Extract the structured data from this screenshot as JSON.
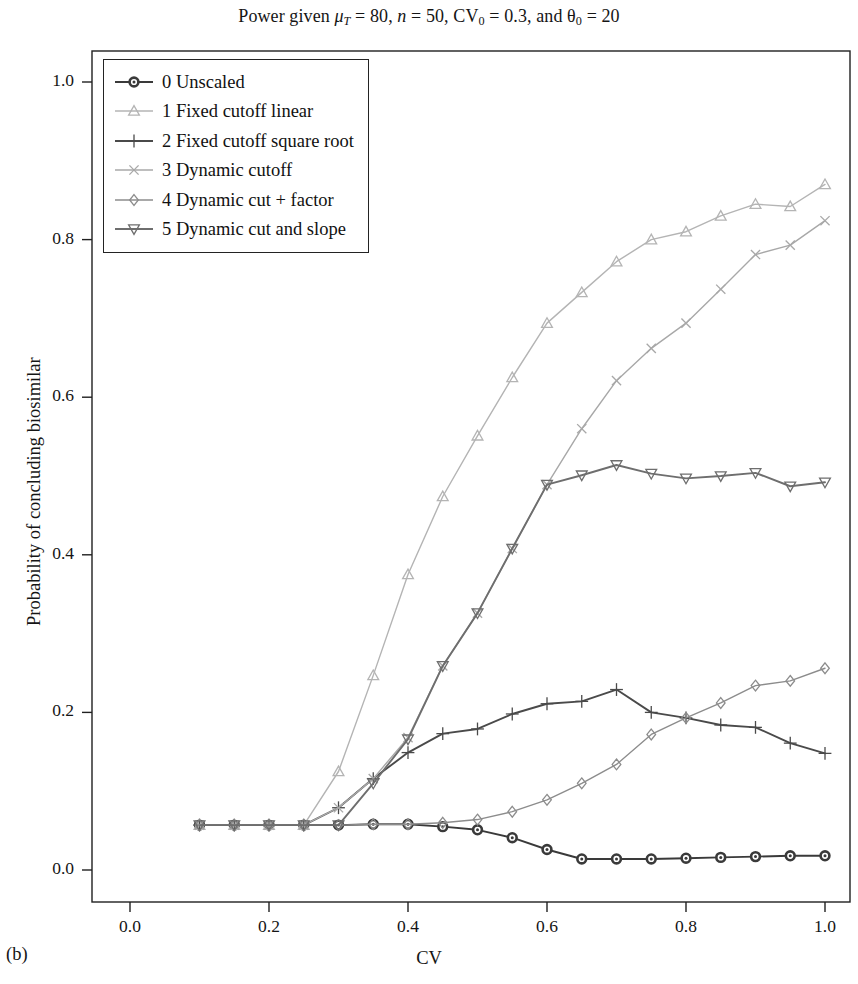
{
  "figure": {
    "panel_label": "(b)",
    "title_plain": "Power given μ_T = 80, n = 50, CV_0 = 0.3, and θ_0 = 20",
    "title_parts": {
      "lead": "Power given ",
      "mu": "μ",
      "mu_sub": "T",
      "mu_val": " = 80, ",
      "n": "n",
      "n_val": " = 50, ",
      "cv": "CV",
      "cv_sub": "0",
      "cv_val": " = 0.3, and ",
      "theta": "θ",
      "theta_sub": "0",
      "theta_val": " = 20"
    }
  },
  "chart_data": {
    "type": "line",
    "xlabel": "CV",
    "ylabel": "Probability of concluding biosimilar",
    "xlim": [
      0.0,
      1.06
    ],
    "ylim": [
      0.0,
      1.04
    ],
    "xticks": [
      0.0,
      0.2,
      0.4,
      0.6,
      0.8,
      1.0
    ],
    "xticklabels": [
      "0.0",
      "0.2",
      "0.4",
      "0.6",
      "0.8",
      "1.0"
    ],
    "yticks": [
      0.0,
      0.2,
      0.4,
      0.6,
      0.8,
      1.0
    ],
    "yticklabels": [
      "0.0",
      "0.2",
      "0.4",
      "0.6",
      "0.8",
      "1.0"
    ],
    "grid": false,
    "legend_position": "upper left",
    "x": [
      0.1,
      0.15,
      0.2,
      0.25,
      0.3,
      0.35,
      0.4,
      0.45,
      0.5,
      0.55,
      0.6,
      0.65,
      0.7,
      0.75,
      0.8,
      0.85,
      0.9,
      0.95,
      1.0
    ],
    "series": [
      {
        "name": "0 Unscaled",
        "index": 0,
        "marker": "circle-filled",
        "color": "#3a3a3a",
        "values": [
          0.057,
          0.057,
          0.057,
          0.057,
          0.057,
          0.058,
          0.058,
          0.055,
          0.051,
          0.041,
          0.026,
          0.014,
          0.014,
          0.014,
          0.015,
          0.016,
          0.017,
          0.018,
          0.018
        ]
      },
      {
        "name": "1 Fixed cutoff linear",
        "index": 1,
        "marker": "triangle-up",
        "color": "#b4b4b4",
        "values": [
          0.057,
          0.057,
          0.057,
          0.057,
          0.125,
          0.247,
          0.375,
          0.474,
          0.551,
          0.625,
          0.694,
          0.733,
          0.772,
          0.8,
          0.81,
          0.83,
          0.845,
          0.842,
          0.87
        ]
      },
      {
        "name": "2 Fixed cutoff square root",
        "index": 2,
        "marker": "plus",
        "color": "#4a4a4a",
        "values": [
          0.057,
          0.057,
          0.057,
          0.057,
          0.079,
          0.116,
          0.149,
          0.173,
          0.179,
          0.198,
          0.211,
          0.214,
          0.229,
          0.2,
          0.193,
          0.184,
          0.181,
          0.161,
          0.148
        ]
      },
      {
        "name": "3 Dynamic cutoff",
        "index": 3,
        "marker": "x",
        "color": "#a8a8a8",
        "values": [
          0.057,
          0.057,
          0.057,
          0.057,
          0.079,
          0.116,
          0.168,
          0.259,
          0.326,
          0.408,
          0.489,
          0.56,
          0.621,
          0.662,
          0.694,
          0.737,
          0.781,
          0.793,
          0.824
        ]
      },
      {
        "name": "4 Dynamic cut + factor",
        "index": 4,
        "marker": "diamond",
        "color": "#8c8c8c",
        "values": [
          0.057,
          0.057,
          0.057,
          0.057,
          0.057,
          0.058,
          0.058,
          0.06,
          0.064,
          0.074,
          0.089,
          0.11,
          0.134,
          0.172,
          0.193,
          0.212,
          0.234,
          0.24,
          0.256
        ]
      },
      {
        "name": "5 Dynamic cut and slope",
        "index": 5,
        "marker": "triangle-down",
        "color": "#6e6e6e",
        "values": [
          0.057,
          0.057,
          0.057,
          0.057,
          0.057,
          0.11,
          0.166,
          0.259,
          0.326,
          0.408,
          0.489,
          0.501,
          0.514,
          0.503,
          0.497,
          0.5,
          0.504,
          0.487,
          0.492
        ]
      }
    ]
  },
  "legend": {
    "items": [
      {
        "label": "0 Unscaled",
        "marker": "circle-filled",
        "color": "#3a3a3a"
      },
      {
        "label": "1 Fixed cutoff linear",
        "marker": "triangle-up",
        "color": "#b4b4b4"
      },
      {
        "label": "2 Fixed cutoff square root",
        "marker": "plus",
        "color": "#4a4a4a"
      },
      {
        "label": "3 Dynamic cutoff",
        "marker": "x",
        "color": "#a8a8a8"
      },
      {
        "label": "4 Dynamic cut + factor",
        "marker": "diamond",
        "color": "#8c8c8c"
      },
      {
        "label": "5 Dynamic cut and slope",
        "marker": "triangle-down",
        "color": "#6e6e6e"
      }
    ]
  }
}
